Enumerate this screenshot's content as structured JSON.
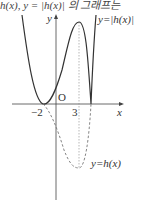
{
  "top_text": "h(x), y = |h(x)| 의 그래프는",
  "axes": {
    "x_label": "x",
    "y_label": "y",
    "origin_label": "O"
  },
  "ticks": {
    "neg2": "−2",
    "three": "3"
  },
  "curves": {
    "abs_label": "y=|h(x)|",
    "h_label": "y=h(x)"
  },
  "colors": {
    "curve": "#333333",
    "dashed": "#777777",
    "axis": "#444444"
  }
}
